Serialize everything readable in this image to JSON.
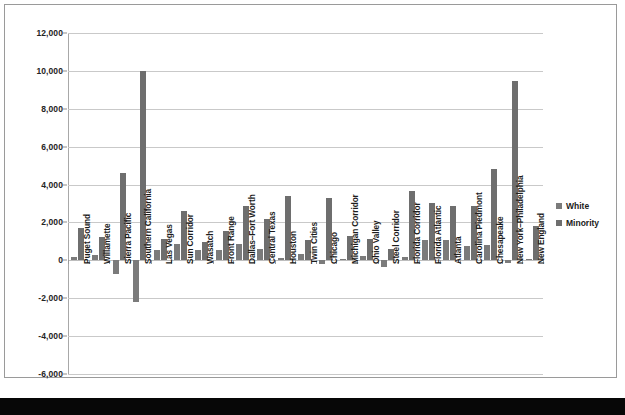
{
  "chart_data": {
    "type": "bar",
    "title": "",
    "subtitle": "",
    "xlabel": "",
    "ylabel": "",
    "ylim": [
      -6000,
      12000
    ],
    "ytick_step": 2000,
    "yticks": [
      "12,000",
      "10,000",
      "8,000",
      "6,000",
      "4,000",
      "2,000",
      "0",
      "-2,000",
      "-4,000",
      "-6,000"
    ],
    "ytick_values": [
      12000,
      10000,
      8000,
      6000,
      4000,
      2000,
      0,
      -2000,
      -4000,
      -6000
    ],
    "grid": true,
    "grid_axis": "y",
    "legend_position": "right",
    "categories": [
      "Puget Sound",
      "Willamette",
      "Sierra Pacific",
      "Southern California",
      "Las Vegas",
      "Sun Corridor",
      "Wasatch",
      "Front Range",
      "Dallas–Fort Worth",
      "Central Texas",
      "Houston",
      "Twin Cities",
      "Chicago",
      "Michigan Corridor",
      "Ohio Valley",
      "Steel Corridor",
      "Florida Corridor",
      "Florida Atlantic",
      "Atlanta",
      "Carolina Piedmont",
      "Chesapeake",
      "New York–Philadelphia",
      "New England"
    ],
    "series": [
      {
        "name": "White",
        "color": "#7b7b7b",
        "values": [
          150,
          300,
          -700,
          -2200,
          550,
          880,
          530,
          540,
          880,
          620,
          120,
          330,
          -180,
          60,
          230,
          -330,
          180,
          1050,
          1080,
          750,
          800,
          -120,
          80
        ]
      },
      {
        "name": "Minority",
        "color": "#6e6e6e",
        "values": [
          1700,
          1250,
          4620,
          10000,
          1120,
          2630,
          980,
          1540,
          2880,
          2160,
          3400,
          1080,
          3280,
          1310,
          1140,
          620,
          3660,
          3050,
          2850,
          2880,
          4830,
          9480,
          1830
        ]
      }
    ]
  },
  "legend": {
    "items": [
      {
        "label": "White",
        "swatch": "white-swatch"
      },
      {
        "label": "Minority",
        "swatch": "minority-swatch"
      }
    ]
  }
}
